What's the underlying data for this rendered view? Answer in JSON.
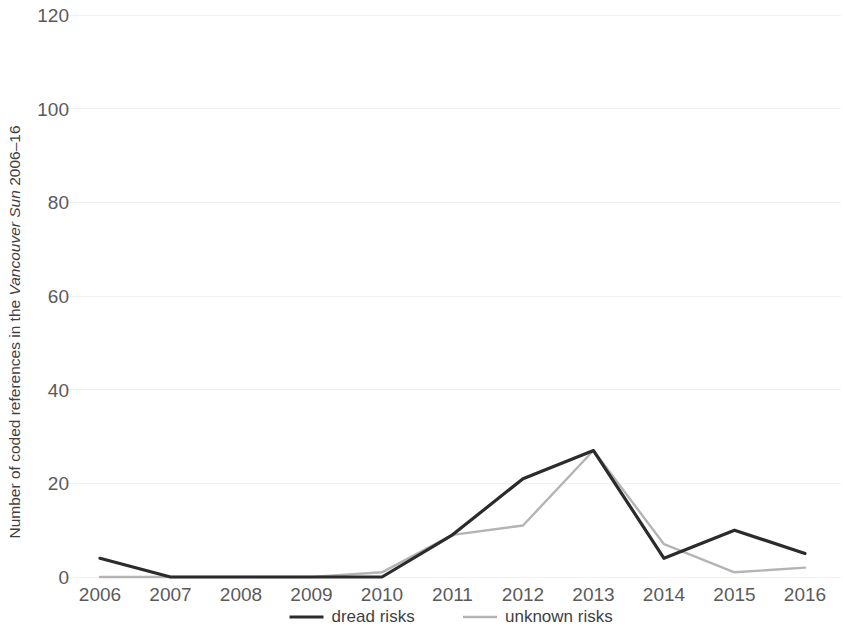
{
  "chart_data": {
    "type": "line",
    "title": "",
    "xlabel": "",
    "ylabel": "Number of coded references in the Vancouver Sun 2006–16",
    "ylabel_parts": {
      "prefix": "Number of coded references in the ",
      "italic": "Vancouver Sun",
      "suffix": " 2006–16"
    },
    "categories": [
      "2006",
      "2007",
      "2008",
      "2009",
      "2010",
      "2011",
      "2012",
      "2013",
      "2014",
      "2015",
      "2016"
    ],
    "x": [
      2006,
      2007,
      2008,
      2009,
      2010,
      2011,
      2012,
      2013,
      2014,
      2015,
      2016
    ],
    "series": [
      {
        "name": "dread risks",
        "color": "#2b2b2b",
        "stroke_width": 3.2,
        "values": [
          4,
          0,
          0,
          0,
          0,
          9,
          21,
          27,
          4,
          10,
          5
        ]
      },
      {
        "name": "unknown risks",
        "color": "#b4b4b4",
        "stroke_width": 2.4,
        "values": [
          0,
          0,
          0,
          0,
          1,
          9,
          11,
          27,
          7,
          1,
          2
        ]
      }
    ],
    "ylim": [
      0,
      120
    ],
    "yticks": [
      0,
      20,
      40,
      60,
      80,
      100,
      120
    ],
    "ytick_labels": [
      "0",
      "20",
      "40",
      "60",
      "80",
      "100",
      "120"
    ],
    "grid": true,
    "grid_color": "#f2f2f2",
    "legend_position": "bottom"
  },
  "legend": {
    "items": [
      {
        "label": "dread risks",
        "color": "#2b2b2b"
      },
      {
        "label": "unknown risks",
        "color": "#b4b4b4"
      }
    ]
  }
}
